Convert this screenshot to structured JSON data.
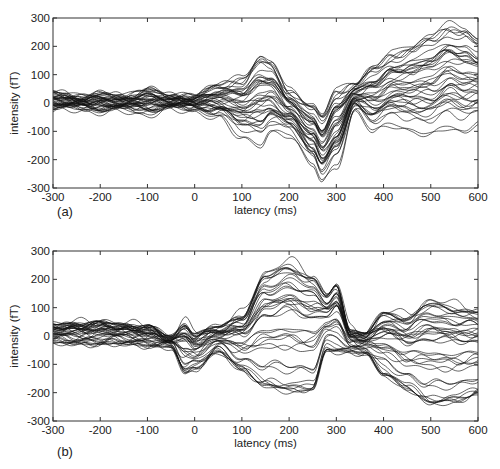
{
  "chart_data": [
    {
      "type": "line",
      "panel_label": "(a)",
      "title": "",
      "xlabel": "latency (ms)",
      "ylabel": "intensity (fT)",
      "xlim": [
        -300,
        600
      ],
      "ylim": [
        -300,
        300
      ],
      "xticks": [
        -300,
        -200,
        -100,
        0,
        100,
        200,
        300,
        400,
        500,
        600
      ],
      "yticks": [
        -300,
        -200,
        -100,
        0,
        100,
        200,
        300
      ],
      "grid": false,
      "legend": null,
      "description": "Overlaid MEG channel waveforms (~40 traces). Small oscillations within ±50 fT before 50 ms; strong deflection peaking ~+190 fT and ~-160 fT near 100-150 ms; broad trough down to ~-290 fT near 270 ms; peak ~+60 fT near 340 ms; late divergence with traces reaching beyond +300 fT near 520-600 ms and down to ~-130 fT.",
      "envelope": {
        "x": [
          -300,
          -250,
          -200,
          -150,
          -100,
          -50,
          0,
          50,
          100,
          140,
          160,
          200,
          250,
          270,
          300,
          340,
          380,
          420,
          460,
          500,
          540,
          570,
          600
        ],
        "upper": [
          45,
          30,
          40,
          30,
          60,
          30,
          35,
          75,
          110,
          190,
          170,
          60,
          10,
          -20,
          70,
          80,
          150,
          200,
          230,
          270,
          310,
          300,
          250
        ],
        "lower": [
          -30,
          -25,
          -35,
          -30,
          -45,
          -25,
          -30,
          -60,
          -130,
          -160,
          -120,
          -120,
          -220,
          -290,
          -240,
          -30,
          -110,
          -90,
          -110,
          -130,
          -100,
          -120,
          -80
        ]
      },
      "series_count_approx": 40
    },
    {
      "type": "line",
      "panel_label": "(b)",
      "title": "",
      "xlabel": "latency (ms)",
      "ylabel": "intensity (fT)",
      "xlim": [
        -300,
        600
      ],
      "ylim": [
        -300,
        300
      ],
      "xticks": [
        -300,
        -200,
        -100,
        0,
        100,
        200,
        300,
        400,
        500,
        600
      ],
      "yticks": [
        -300,
        -200,
        -100,
        0,
        100,
        200,
        300
      ],
      "grid": false,
      "legend": null,
      "description": "Overlaid MEG channel waveforms (~40 traces). Oscillations within ±50 fT before -50 ms; deflection to +60/-140 fT near -30 to 0 ms; broad divergence 100-280 ms with upper traces peaking ~+290 fT at ~200 ms and lower traces ~-220 fT; sharp peak near 300 ms (~+200 fT); convergence near 350 ms; late spread from ~+150 fT to ~-270 fT at 500-600 ms.",
      "envelope": {
        "x": [
          -300,
          -250,
          -200,
          -150,
          -100,
          -50,
          -20,
          0,
          50,
          100,
          150,
          200,
          250,
          280,
          300,
          330,
          360,
          400,
          450,
          500,
          550,
          600
        ],
        "upper": [
          45,
          50,
          55,
          45,
          40,
          0,
          60,
          20,
          40,
          90,
          250,
          290,
          240,
          160,
          200,
          30,
          10,
          100,
          90,
          150,
          130,
          110
        ],
        "lower": [
          -25,
          -30,
          -30,
          -30,
          -35,
          -40,
          -140,
          -120,
          -60,
          -130,
          -200,
          -220,
          -210,
          -60,
          -70,
          -60,
          -60,
          -150,
          -200,
          -260,
          -250,
          -220
        ]
      },
      "series_count_approx": 40
    }
  ],
  "panels": [
    {
      "label": "(a)",
      "xlabel": "latency (ms)",
      "ylabel": "intensity (fT)",
      "xticks": [
        "-300",
        "-200",
        "-100",
        "0",
        "100",
        "200",
        "300",
        "400",
        "500",
        "600"
      ],
      "yticks": [
        "300",
        "200",
        "100",
        "0",
        "-100",
        "-200",
        "-300"
      ]
    },
    {
      "label": "(b)",
      "xlabel": "latency (ms)",
      "ylabel": "intensity (fT)",
      "xticks": [
        "-300",
        "-200",
        "-100",
        "0",
        "100",
        "200",
        "300",
        "400",
        "500",
        "600"
      ],
      "yticks": [
        "300",
        "200",
        "100",
        "0",
        "-100",
        "-200",
        "-300"
      ]
    }
  ]
}
